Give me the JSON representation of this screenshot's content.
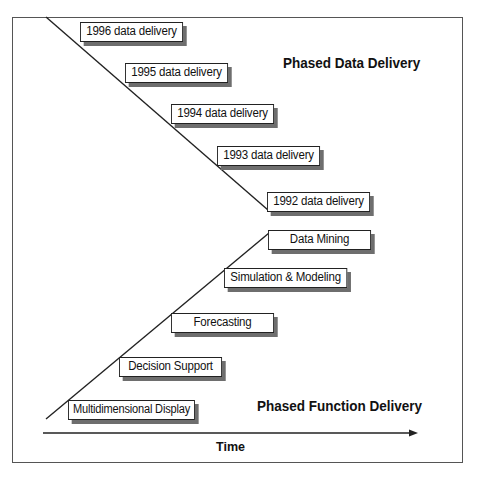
{
  "diagram": {
    "headings": {
      "data": "Phased Data Delivery",
      "function": "Phased Function Delivery"
    },
    "axis_label": "Time",
    "data_deliveries": [
      {
        "label": "1996 data delivery"
      },
      {
        "label": "1995 data delivery"
      },
      {
        "label": "1994 data delivery"
      },
      {
        "label": "1993 data delivery"
      },
      {
        "label": "1992 data delivery"
      }
    ],
    "function_deliveries": [
      {
        "label": "Data Mining"
      },
      {
        "label": "Simulation & Modeling"
      },
      {
        "label": "Forecasting"
      },
      {
        "label": "Decision Support"
      },
      {
        "label": "Multidimensional Display"
      }
    ],
    "colors": {
      "line": "#222222",
      "shadow": "#6e6e6e",
      "frame": "#555555"
    }
  }
}
